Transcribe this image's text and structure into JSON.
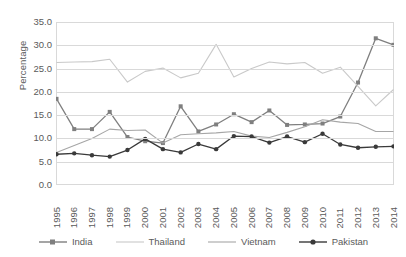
{
  "chart_data": {
    "type": "line",
    "title": "",
    "xlabel": "",
    "ylabel": "Percentage",
    "ylim": [
      0,
      35
    ],
    "ytick_step": 5,
    "grid": true,
    "legend_position": "bottom",
    "categories": [
      "1995",
      "1996",
      "1997",
      "1998",
      "1999",
      "2000",
      "2001",
      "2002",
      "2003",
      "2004",
      "2005",
      "2006",
      "2007",
      "2008",
      "2009",
      "2010",
      "2011",
      "2012",
      "2013",
      "2014"
    ],
    "yticks": [
      "0.0",
      "5.0",
      "10.0",
      "15.0",
      "20.0",
      "25.0",
      "30.0",
      "35.0"
    ],
    "series": [
      {
        "name": "India",
        "color": "#7f7f7f",
        "marker": "square",
        "values": [
          18.5,
          12.0,
          12.0,
          15.7,
          10.3,
          9.4,
          9.0,
          16.9,
          11.5,
          13.0,
          15.2,
          13.5,
          16.0,
          12.9,
          13.0,
          13.2,
          14.7,
          22.0,
          31.5,
          30.1
        ]
      },
      {
        "name": "Thailand",
        "color": "#c9c9c9",
        "marker": "none",
        "values": [
          26.3,
          26.4,
          26.5,
          27.0,
          22.1,
          24.4,
          25.1,
          23.0,
          24.0,
          30.2,
          23.2,
          25.0,
          26.4,
          26.0,
          26.3,
          24.0,
          25.3,
          21.2,
          17.0,
          20.5
        ]
      },
      {
        "name": "Vietnam",
        "color": "#a6a6a6",
        "marker": "none",
        "values": [
          7.0,
          8.5,
          10.0,
          12.0,
          11.7,
          11.8,
          9.0,
          10.8,
          11.0,
          11.2,
          11.5,
          10.5,
          10.2,
          11.3,
          12.5,
          14.0,
          13.5,
          13.2,
          11.5,
          11.5
        ]
      },
      {
        "name": "Pakistan",
        "color": "#3a3a3a",
        "marker": "circle",
        "values": [
          6.6,
          6.8,
          6.4,
          6.1,
          7.5,
          9.9,
          7.7,
          7.0,
          8.8,
          7.7,
          10.5,
          10.4,
          9.1,
          10.4,
          9.2,
          11.0,
          8.7,
          8.0,
          8.2,
          8.3
        ]
      }
    ]
  }
}
